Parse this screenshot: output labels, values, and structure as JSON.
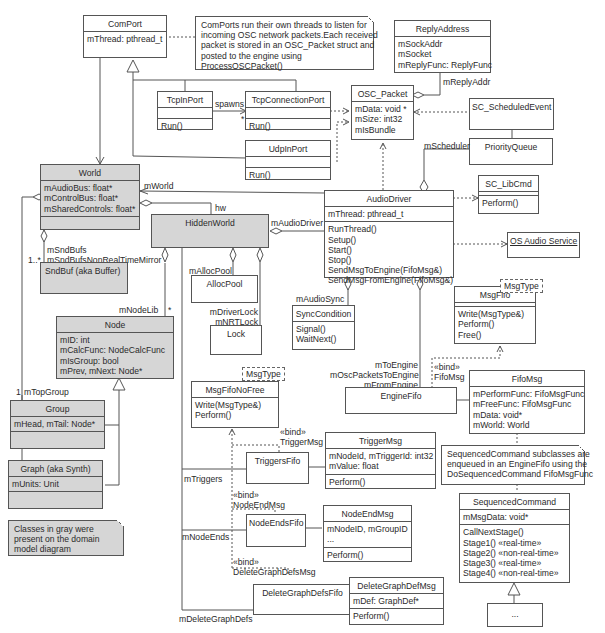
{
  "diagram": {
    "type": "UML class diagram",
    "classes": {
      "comport": {
        "name": "ComPort",
        "attributes": [
          "mThread: pthread_t"
        ],
        "operations": []
      },
      "tcpinport": {
        "name": "TcpInPort",
        "attributes": [],
        "operations": [
          "Run()"
        ]
      },
      "tcpconnectionport": {
        "name": "TcpConnectionPort",
        "attributes": [],
        "operations": [
          "Run()"
        ]
      },
      "udpinport": {
        "name": "UdpInPort",
        "attributes": [],
        "operations": [
          "Run()"
        ]
      },
      "replyaddress": {
        "name": "ReplyAddress",
        "attributes": [
          "mSockAddr",
          "mSocket",
          "mReplyFunc: ReplyFunc"
        ]
      },
      "oscpacket": {
        "name": "OSC_Packet",
        "attributes": [
          "mData: void *",
          "mSize: int32",
          "mIsBundle"
        ]
      },
      "scheduledevent": {
        "name": "SC_ScheduledEvent"
      },
      "priorityqueue": {
        "name": "PriorityQueue"
      },
      "libcmd": {
        "name": "SC_LibCmd",
        "operations": [
          "Perform()"
        ]
      },
      "world": {
        "name": "World",
        "attributes": [
          "mAudioBus: float*",
          "mControlBus: float*",
          "mSharedControls: float*"
        ]
      },
      "hiddenworld": {
        "name": "HiddenWorld"
      },
      "audiodriver": {
        "name": "AudioDriver",
        "attributes": [
          "mThread: pthread_t"
        ],
        "operations": [
          "RunThread()",
          "Setup()",
          "Start()",
          "Stop()",
          "SendMsgToEngine(FifoMsg&)",
          "SendMsgFromEngine(FifoMsg&)"
        ]
      },
      "osaudio": {
        "name": "OS Audio Service"
      },
      "sndbuf": {
        "name": "SndBuf (aka Buffer)"
      },
      "allocpool": {
        "name": "AllocPool"
      },
      "lock": {
        "name": "Lock"
      },
      "synccondition": {
        "name": "SyncCondition",
        "operations": [
          "Signal()",
          "WaitNext()"
        ]
      },
      "msgfifo": {
        "name": "MsgFifo",
        "template": "MsgType",
        "operations": [
          "Write(MsgType&)",
          "Perform()",
          "Free()"
        ]
      },
      "node": {
        "name": "Node",
        "attributes": [
          "mID: int",
          "mCalcFunc: NodeCalcFunc",
          "mIsGroup: bool",
          "mPrev, mNext: Node*"
        ]
      },
      "msgfifonofree": {
        "name": "MsgFifoNoFree",
        "template": "MsgType",
        "operations": [
          "Write(MsgType&)",
          "Perform()"
        ]
      },
      "enginefifo": {
        "name": "EngineFifo"
      },
      "fifomsg": {
        "name": "FifoMsg",
        "attributes": [
          "mPerformFunc: FifoMsgFunc",
          "mFreeFunc: FifoMsgFunc",
          "mData: void*",
          "mWorld: World"
        ]
      },
      "group": {
        "name": "Group",
        "attributes": [
          "mHead, mTail: Node*"
        ]
      },
      "triggersfifo": {
        "name": "TriggersFifo"
      },
      "triggermsg": {
        "name": "TriggerMsg",
        "attributes": [
          "mNodeId, mTriggerId: int32",
          "mValue: float"
        ],
        "operations": [
          "Perform()"
        ]
      },
      "graph": {
        "name": "Graph (aka Synth)",
        "attributes": [
          "mUnits: Unit"
        ]
      },
      "nodeendsfifo": {
        "name": "NodeEndsFifo"
      },
      "nodeendmsg": {
        "name": "NodeEndMsg",
        "attributes": [
          "mNodeID, mGroupID",
          "..."
        ],
        "operations": [
          "Perform()"
        ]
      },
      "deletegraphdefsfifo": {
        "name": "DeleteGraphDefsFifo"
      },
      "deletegraphdefmsg": {
        "name": "DeleteGraphDefMsg",
        "attributes": [
          "mDef: GraphDef*"
        ],
        "operations": [
          "Perform()"
        ]
      },
      "sequencedcommand": {
        "name": "SequencedCommand",
        "attributes": [
          "mMsgData: void*"
        ],
        "operations": [
          "CallNextStage()",
          "Stage1() «real-time»",
          "Stage2() «non-real-time»",
          "Stage3() «real-time»",
          "Stage4() «non-real-time»"
        ]
      },
      "subclass": {
        "name": "..."
      }
    },
    "notes": {
      "comport_note": [
        "ComPorts run their own threads to listen for",
        "incoming OSC network packets.Each received",
        "packet is stored in an OSC_Packet struct and",
        "posted to the engine using",
        "ProcessOSCPacket()"
      ],
      "seqcmd_note": [
        "SequencedCommand subclasses are",
        "enqueued in an EngineFifo using the",
        "DoSequencedCommand FifoMsgFunc"
      ],
      "legend_note": [
        "Classes in gray were",
        "present on the domain",
        "model diagram"
      ]
    },
    "labels": {
      "spawns": "spawns",
      "star1": "*",
      "mreplyaddr": "mReplyAddr",
      "mscheduler": "mScheduler",
      "mworld": "mWorld",
      "hw": "hw",
      "maudiodriver": "mAudioDriver",
      "msndbufs": [
        "mSndBufs",
        "mSndBufsNonRealTimeMirror"
      ],
      "one_many": "1..*",
      "mallocpool": "mAllocPool",
      "mlocks": [
        "mDriverLock",
        "mNRTLock"
      ],
      "maudiosync": "mAudioSync",
      "mnodelib": "mNodeLib",
      "star2": "*",
      "one": "1",
      "mtopgroup": "mTopGroup",
      "engine_roles": [
        "mToEngine",
        "mOscPacketsToEngine",
        "mFromEngine"
      ],
      "bind_fifomsg": [
        "«bind»",
        "FifoMsg"
      ],
      "bind_triggermsg": [
        "«bind»",
        "TriggerMsg"
      ],
      "bind_nodeendmsg": [
        "«bind»",
        "NodeEndMsg"
      ],
      "bind_deletegraphdefsmsg": [
        "«bind»",
        "DeleteGraphDefsMsg"
      ],
      "mtriggers": "mTriggers",
      "mnodeends": "mNodeEnds",
      "mdeletegraphdefs": "mDeleteGraphDefs"
    },
    "colors": {
      "gray_class": "#d6d6d6",
      "line": "#555555",
      "background": "#ffffff"
    }
  }
}
